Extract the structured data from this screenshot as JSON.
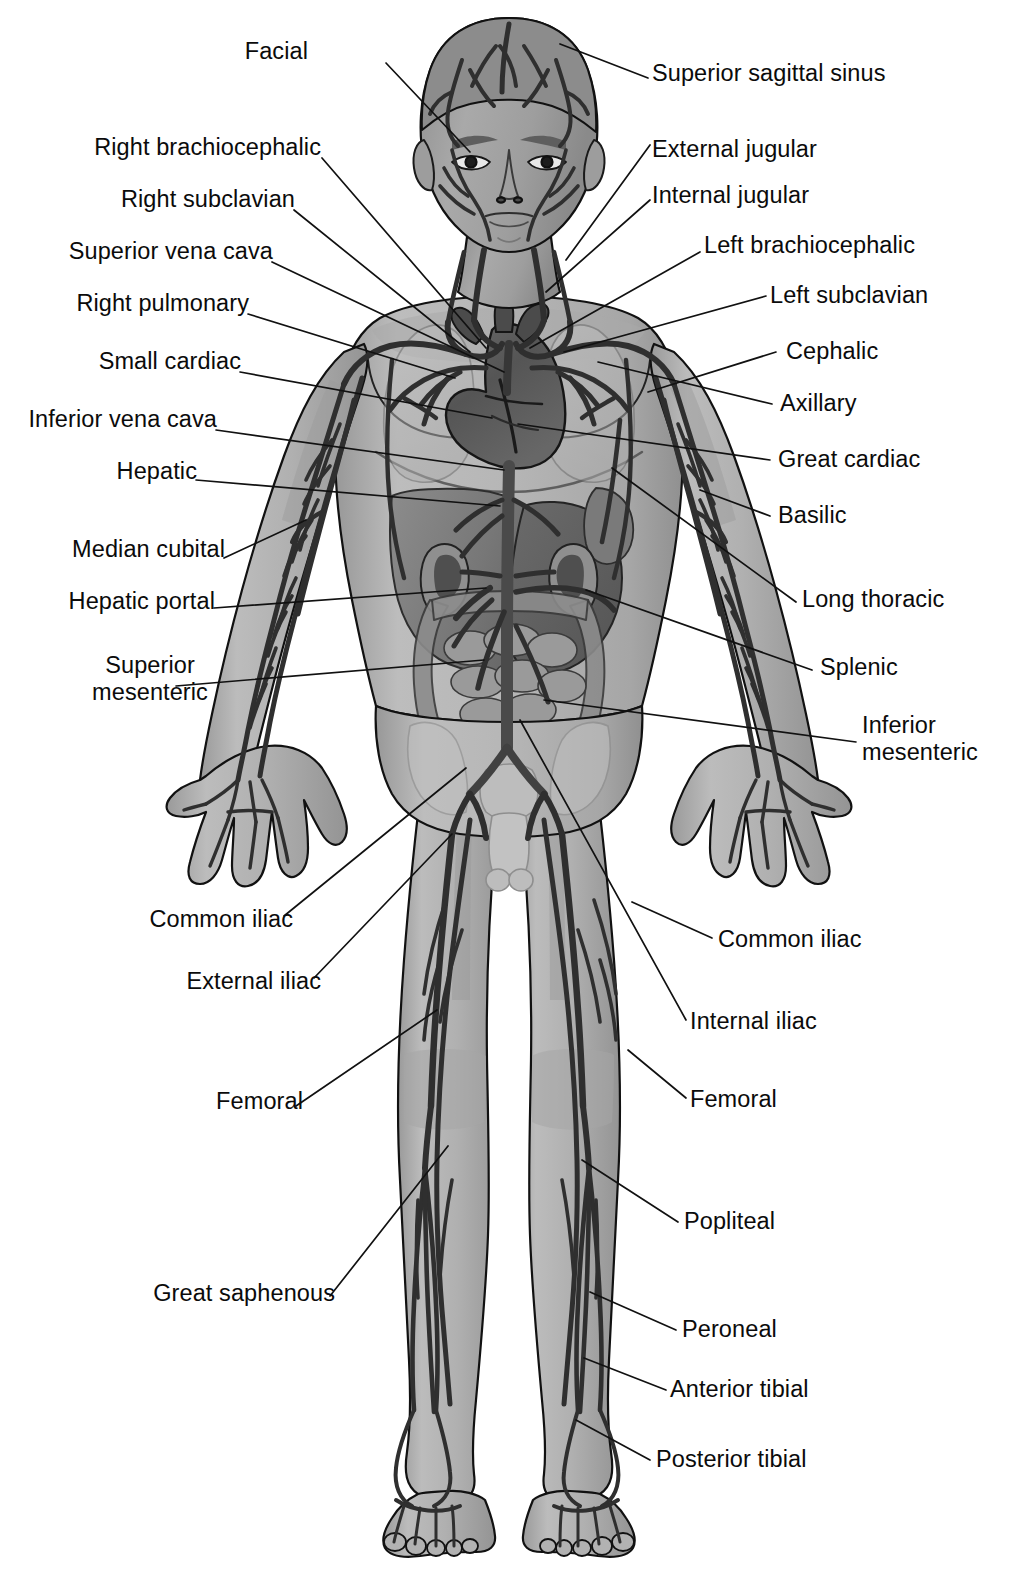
{
  "figure": {
    "colors": {
      "background": "#ffffff",
      "skin_light": "#b4b4b4",
      "skin_mid": "#a0a0a0",
      "skin_shadow": "#8d8d8d",
      "vessel_dark": "#3d3d3d",
      "vessel_outline": "#111111",
      "organ_dark": "#565656",
      "organ_mid": "#6e6e6e",
      "organ_light": "#8a8a8a",
      "leader_line": "#111111",
      "text": "#0b0b0b"
    },
    "parts": [
      "head",
      "face",
      "neck",
      "thorax",
      "heart",
      "lungs",
      "liver",
      "stomach",
      "spleen",
      "kidneys",
      "small-intestine",
      "large-intestine",
      "pelvis",
      "arms",
      "hands",
      "legs",
      "feet"
    ]
  },
  "labels": {
    "left": [
      {
        "id": "facial",
        "text": "Facial"
      },
      {
        "id": "right-brachiocephalic",
        "text": "Right brachiocephalic"
      },
      {
        "id": "right-subclavian",
        "text": "Right subclavian"
      },
      {
        "id": "superior-vena-cava",
        "text": "Superior vena cava"
      },
      {
        "id": "right-pulmonary",
        "text": "Right pulmonary"
      },
      {
        "id": "small-cardiac",
        "text": "Small cardiac"
      },
      {
        "id": "inferior-vena-cava",
        "text": "Inferior vena cava"
      },
      {
        "id": "hepatic",
        "text": "Hepatic"
      },
      {
        "id": "median-cubital",
        "text": "Median cubital"
      },
      {
        "id": "hepatic-portal",
        "text": "Hepatic portal"
      },
      {
        "id": "superior-mesenteric",
        "text": "Superior\nmesenteric"
      },
      {
        "id": "common-iliac-left",
        "text": "Common iliac"
      },
      {
        "id": "external-iliac",
        "text": "External iliac"
      },
      {
        "id": "femoral-left",
        "text": "Femoral"
      },
      {
        "id": "great-saphenous",
        "text": "Great saphenous"
      }
    ],
    "right": [
      {
        "id": "superior-sagittal-sinus",
        "text": "Superior sagittal sinus"
      },
      {
        "id": "external-jugular",
        "text": "External jugular"
      },
      {
        "id": "internal-jugular",
        "text": "Internal jugular"
      },
      {
        "id": "left-brachiocephalic",
        "text": "Left brachiocephalic"
      },
      {
        "id": "left-subclavian",
        "text": "Left subclavian"
      },
      {
        "id": "cephalic",
        "text": "Cephalic"
      },
      {
        "id": "axillary",
        "text": "Axillary"
      },
      {
        "id": "great-cardiac",
        "text": "Great cardiac"
      },
      {
        "id": "basilic",
        "text": "Basilic"
      },
      {
        "id": "long-thoracic",
        "text": "Long thoracic"
      },
      {
        "id": "splenic",
        "text": "Splenic"
      },
      {
        "id": "inferior-mesenteric",
        "text": "Inferior\nmesenteric"
      },
      {
        "id": "common-iliac-right",
        "text": "Common iliac"
      },
      {
        "id": "internal-iliac",
        "text": "Internal iliac"
      },
      {
        "id": "femoral-right",
        "text": "Femoral"
      },
      {
        "id": "popliteal",
        "text": "Popliteal"
      },
      {
        "id": "peroneal",
        "text": "Peroneal"
      },
      {
        "id": "anterior-tibial",
        "text": "Anterior tibial"
      },
      {
        "id": "posterior-tibial",
        "text": "Posterior tibial"
      }
    ]
  }
}
